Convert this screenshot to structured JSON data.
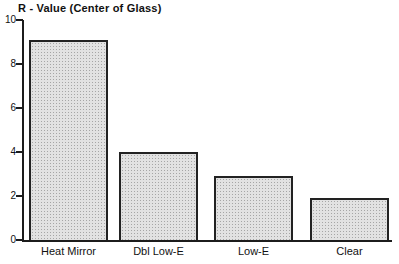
{
  "chart_data": {
    "type": "bar",
    "title": "R - Value (Center of Glass)",
    "categories": [
      "Heat Mirror",
      "Dbl Low-E",
      "Low-E",
      "Clear"
    ],
    "values": [
      9.1,
      4.0,
      2.9,
      1.9
    ],
    "xlabel": "",
    "ylabel": "R - Value (Center of Glass)",
    "ylim": [
      0,
      10
    ],
    "yticks": [
      0,
      2,
      4,
      6,
      8,
      10
    ],
    "grid": false,
    "legend": false,
    "colors": {
      "background": "#ffffff",
      "bar_fill": "#d8d8d8",
      "bar_dot": "#a6a6a6",
      "bar_border": "#222222",
      "axis": "#1c1c1c",
      "text": "#111111"
    }
  }
}
